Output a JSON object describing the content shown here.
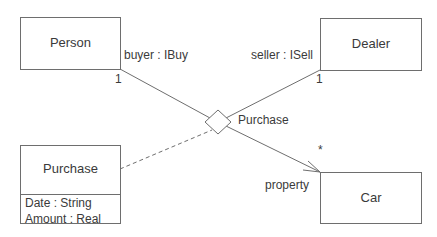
{
  "diagram": {
    "type": "UML class diagram",
    "classes": [
      {
        "id": "person",
        "name": "Person"
      },
      {
        "id": "dealer",
        "name": "Dealer"
      },
      {
        "id": "car",
        "name": "Car"
      },
      {
        "id": "purchase",
        "name": "Purchase",
        "attributes": [
          "Date : String",
          "Amount : Real"
        ]
      }
    ],
    "association": {
      "name": "Purchase",
      "kind": "n-ary association (diamond)",
      "roles": [
        {
          "class": "Person",
          "role": "buyer : IBuy",
          "multiplicity": "1"
        },
        {
          "class": "Dealer",
          "role": "seller : ISell",
          "multiplicity": "1"
        },
        {
          "class": "Car",
          "role": "property",
          "multiplicity": "*",
          "navigable": true
        }
      ],
      "association_class": "Purchase"
    }
  }
}
